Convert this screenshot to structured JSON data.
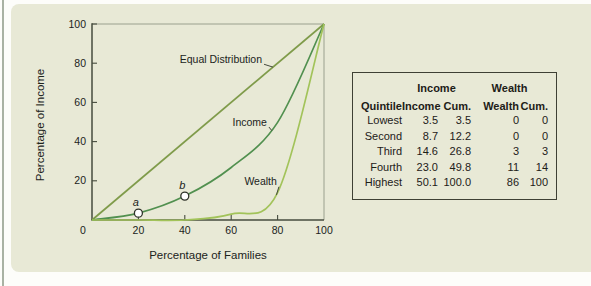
{
  "chart_data": {
    "type": "line",
    "title": "",
    "xlabel": "Percentage of Families",
    "ylabel": "Percentage of Income",
    "xlim": [
      0,
      100
    ],
    "ylim": [
      0,
      100
    ],
    "x_ticks": [
      0,
      20,
      40,
      60,
      80,
      100
    ],
    "y_ticks": [
      20,
      40,
      60,
      80,
      100
    ],
    "grid": "off",
    "legend": "none (inline curve labels with leader lines)",
    "series": [
      {
        "name": "Equal Distribution",
        "color": "#7f9b4a",
        "x": [
          0,
          100
        ],
        "y": [
          0,
          100
        ]
      },
      {
        "name": "Income",
        "color": "#51904f",
        "x": [
          0,
          20,
          40,
          60,
          80,
          100
        ],
        "y": [
          0,
          3.5,
          12.2,
          26.8,
          49.8,
          100
        ]
      },
      {
        "name": "Wealth",
        "color": "#a2c35a",
        "x": [
          0,
          20,
          40,
          60,
          80,
          100
        ],
        "y": [
          0,
          0,
          0,
          3,
          14,
          100
        ]
      }
    ],
    "points": [
      {
        "label": "a",
        "x": 20,
        "y": 3.5
      },
      {
        "label": "b",
        "x": 40,
        "y": 12.2
      }
    ],
    "annotations": [
      {
        "label": "Equal Distribution",
        "text_x": 73.3,
        "text_y": 82,
        "target_x": 78,
        "target_y": 78
      },
      {
        "label": "Income",
        "text_x": 75.4,
        "text_y": 50,
        "target_x": 77.5,
        "target_y": 45.6
      },
      {
        "label": "Wealth",
        "text_x": 79.7,
        "text_y": 19.5,
        "target_x": 79.5,
        "target_y": 12.8
      }
    ]
  },
  "table": {
    "group_headers": [
      {
        "label": "Income",
        "span": 2
      },
      {
        "label": "Wealth",
        "span": 2
      }
    ],
    "columns": [
      "Quintile",
      "Income",
      "Cum.",
      "Wealth",
      "Cum."
    ],
    "rows": [
      [
        "Lowest",
        "3.5",
        "3.5",
        "0",
        "0"
      ],
      [
        "Second",
        "8.7",
        "12.2",
        "0",
        "0"
      ],
      [
        "Third",
        "14.6",
        "26.8",
        "3",
        "3"
      ],
      [
        "Fourth",
        "23.0",
        "49.8",
        "11",
        "14"
      ],
      [
        "Highest",
        "50.1",
        "100.0",
        "86",
        "100"
      ]
    ]
  },
  "colors": {
    "panel_background": "#e8e9d6",
    "page_background": "#fdfdfa",
    "axis": "#464b3e",
    "frame": "#9aa08e",
    "text": "#20231b",
    "equal_distribution_line": "#7f9b4a",
    "income_line": "#51904f",
    "wealth_line": "#a2c35a"
  }
}
